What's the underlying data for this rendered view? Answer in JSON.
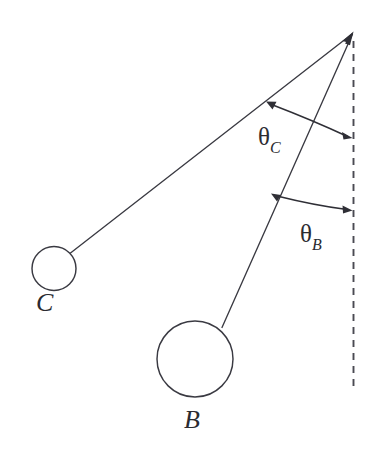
{
  "figure": {
    "type": "physics-diagram",
    "background_color": "#ffffff",
    "line_color": "#3a3a42",
    "label_color": "#2b2b31",
    "width": 382,
    "height": 455
  },
  "pivot": {
    "name": "pivot-point",
    "x": 353,
    "y": 33
  },
  "vertical_reference": {
    "name": "vertical-dashed-reference-line",
    "style": "dashed",
    "x": 353,
    "y_top": 40,
    "y_bottom": 386,
    "color": "#4a4a52"
  },
  "pendulums": [
    {
      "id": "C",
      "label": "C",
      "rod": {
        "x1": 353,
        "y1": 33,
        "x2": 70,
        "y2": 253
      },
      "bob": {
        "cx": 54,
        "cy": 268,
        "r": 22
      },
      "label_position": {
        "x": 36,
        "y": 290
      },
      "angle_from_vertical_deg": 52
    },
    {
      "id": "B",
      "label": "B",
      "rod": {
        "x1": 353,
        "y1": 33,
        "x2": 222,
        "y2": 327
      },
      "bob": {
        "cx": 195,
        "cy": 359,
        "r": 38
      },
      "label_position": {
        "x": 184,
        "y": 407
      },
      "angle_from_vertical_deg": 24
    }
  ],
  "angles": [
    {
      "id": "theta-C",
      "glyph": "θ",
      "subscript": "C",
      "label_position": {
        "x": 258,
        "y": 124
      },
      "arc": {
        "start": {
          "x": 267,
          "y": 102
        },
        "end": {
          "x": 351,
          "y": 137
        },
        "radius": 78,
        "double_headed": true
      },
      "measures": "angle between rod C and the vertical dashed reference"
    },
    {
      "id": "theta-B",
      "glyph": "θ",
      "subscript": "B",
      "label_position": {
        "x": 300,
        "y": 221
      },
      "arc": {
        "start": {
          "x": 272,
          "y": 194
        },
        "end": {
          "x": 351,
          "y": 210
        },
        "radius": 182,
        "double_headed": true
      },
      "measures": "angle between rod B and the vertical dashed reference"
    }
  ]
}
